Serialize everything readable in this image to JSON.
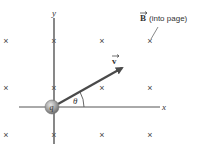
{
  "diagram": {
    "axes": {
      "x_label": "x",
      "y_label": "y"
    },
    "charge": {
      "label": "q"
    },
    "velocity": {
      "label": "v",
      "vector": true
    },
    "angle": {
      "label": "θ"
    },
    "field": {
      "symbol": "B",
      "note": "(into page)",
      "marker": "×"
    },
    "field_markers": {
      "columns": 4,
      "rows": 3
    },
    "colors": {
      "axes": "#555555",
      "arrow": "#4a4a4a",
      "marker": "#444444",
      "charge_fill": "#9a9a9a",
      "text": "#333333"
    }
  }
}
